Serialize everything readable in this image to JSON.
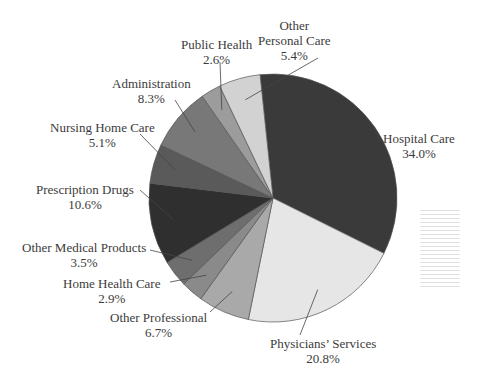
{
  "chart_data": {
    "type": "pie",
    "title": "",
    "categories": [
      "Hospital Care",
      "Physicians' Services",
      "Other Professional",
      "Home Health Care",
      "Other Medical Products",
      "Prescription Drugs",
      "Nursing Home Care",
      "Administration",
      "Public Health",
      "Other Personal Care"
    ],
    "values": [
      34.0,
      20.8,
      6.7,
      2.9,
      3.5,
      10.6,
      5.1,
      8.3,
      2.6,
      5.4
    ],
    "value_labels": [
      "34.0%",
      "20.8%",
      "6.7%",
      "2.9%",
      "3.5%",
      "10.6%",
      "5.1%",
      "8.3%",
      "2.6%",
      "5.4%"
    ],
    "colors": [
      "#3a3a3a",
      "#e6e6e6",
      "#a9a9a9",
      "#8a8a8a",
      "#6e6e6e",
      "#2f2f2f",
      "#5a5a5a",
      "#787878",
      "#9c9c9c",
      "#d2d2d2"
    ],
    "start_angle_deg": -6,
    "direction": "clockwise",
    "legend": "none (callout labels)"
  },
  "labels": [
    {
      "name": "Hospital Care",
      "pct": "34.0%"
    },
    {
      "name": "Physicians’ Services",
      "pct": "20.8%"
    },
    {
      "name": "Other Professional",
      "pct": "6.7%"
    },
    {
      "name": "Home Health Care",
      "pct": "2.9%"
    },
    {
      "name": "Other Medical Products",
      "pct": "3.5%"
    },
    {
      "name": "Prescription Drugs",
      "pct": "10.6%"
    },
    {
      "name": "Nursing Home Care",
      "pct": "5.1%"
    },
    {
      "name": "Administration",
      "pct": "8.3%"
    },
    {
      "name": "Public Health",
      "pct": "2.6%"
    },
    {
      "name": "Other",
      "name2": "Personal Care",
      "pct": "5.4%"
    }
  ]
}
